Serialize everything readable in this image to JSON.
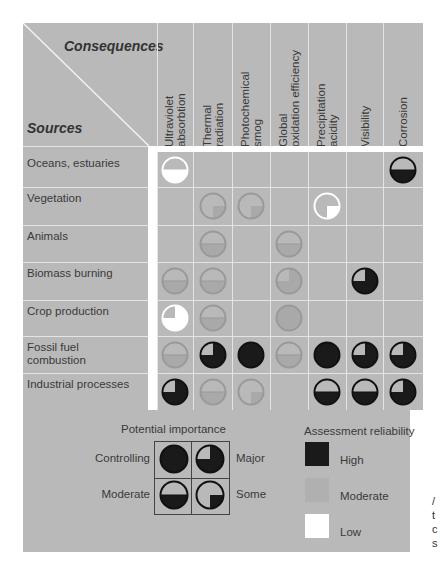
{
  "title_corner": {
    "consequences": "Consequences",
    "sources": "Sources"
  },
  "columns": [
    "Ultraviolet absorbtion",
    "Thermal radiation",
    "Photochemical smog",
    "Global oxidation efficiency",
    "Precipitation acidity",
    "Visibility",
    "Corrosion"
  ],
  "column_lines": [
    [
      "Ultraviolet",
      "absorbtion"
    ],
    [
      "Thermal",
      "radiation"
    ],
    [
      "Photochemical",
      "smog"
    ],
    [
      "Global",
      "oxidation efficiency"
    ],
    [
      "Precipitation",
      "acidity"
    ],
    [
      "Visibility"
    ],
    [
      "Corrosion"
    ]
  ],
  "rows": [
    {
      "label": "Oceans, estuaries",
      "cells": [
        [
          "moderate",
          "low"
        ],
        null,
        null,
        null,
        null,
        null,
        [
          "moderate",
          "high"
        ]
      ]
    },
    {
      "label": "Vegetation",
      "cells": [
        null,
        [
          "some",
          "moderate"
        ],
        [
          "some",
          "moderate"
        ],
        null,
        [
          "some",
          "low"
        ],
        null,
        null
      ]
    },
    {
      "label": "Animals",
      "cells": [
        null,
        [
          "moderate",
          "moderate"
        ],
        null,
        [
          "moderate",
          "moderate"
        ],
        null,
        null,
        null
      ]
    },
    {
      "label": "Biomass burning",
      "cells": [
        [
          "moderate",
          "moderate"
        ],
        [
          "moderate",
          "moderate"
        ],
        null,
        [
          "major",
          "moderate"
        ],
        null,
        [
          "major",
          "high"
        ],
        null
      ]
    },
    {
      "label": "Crop production",
      "cells": [
        [
          "major",
          "low"
        ],
        [
          "moderate",
          "moderate"
        ],
        null,
        [
          "controlling",
          "moderate"
        ],
        null,
        null,
        null
      ]
    },
    {
      "label": "Fossil fuel combustion",
      "label_lines": [
        "Fossil fuel",
        "combustion"
      ],
      "cells": [
        [
          "moderate",
          "moderate"
        ],
        [
          "major",
          "high"
        ],
        [
          "controlling",
          "high"
        ],
        [
          "moderate",
          "moderate"
        ],
        [
          "controlling",
          "high"
        ],
        [
          "major",
          "high"
        ],
        [
          "major",
          "high"
        ]
      ]
    },
    {
      "label": "Industrial processes",
      "cells": [
        [
          "major",
          "high"
        ],
        [
          "moderate",
          "moderate"
        ],
        [
          "some",
          "moderate"
        ],
        null,
        [
          "moderate",
          "high"
        ],
        [
          "moderate",
          "high"
        ],
        [
          "major",
          "high"
        ]
      ]
    }
  ],
  "legend": {
    "importance_title": "Potential importance",
    "importance": [
      {
        "label": "Controlling",
        "symbol": "controlling"
      },
      {
        "label": "Major",
        "symbol": "major"
      },
      {
        "label": "Moderate",
        "symbol": "moderate"
      },
      {
        "label": "Some",
        "symbol": "some"
      }
    ],
    "reliability_title": "Assessment reliability",
    "reliability": [
      {
        "label": "High",
        "color": "#1a1a1a"
      },
      {
        "label": "Moderate",
        "color": "#b0b0b0"
      },
      {
        "label": "Low",
        "color": "#ffffff"
      }
    ]
  },
  "side_fragment": [
    "/",
    "t",
    "c",
    "s"
  ],
  "colors": {
    "panel": "#b9b9b9",
    "grid": "#e4e4e4",
    "high": "#1a1a1a",
    "moderate": "#a9a9a9",
    "low": "#ffffff"
  }
}
